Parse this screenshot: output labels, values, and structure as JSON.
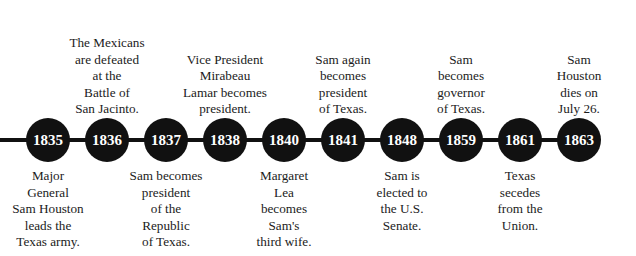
{
  "figure": {
    "type": "horizontal-timeline",
    "title": "",
    "background_color": "#ffffff",
    "node_color": "#111111",
    "node_text_color": "#ffffff",
    "caption_color": "#1b1b1b",
    "axis_color": "#111111"
  },
  "events": [
    {
      "year": "1835",
      "caption": "Major\nGeneral\nSam Houston\nleads the\nTexas army.",
      "caption_position": "below",
      "x": 48
    },
    {
      "year": "1836",
      "caption": "The Mexicans\nare defeated\nat the\nBattle of\nSan Jacinto.",
      "caption_position": "above",
      "x": 107
    },
    {
      "year": "1837",
      "caption": "Sam becomes\npresident\nof the\nRepublic\nof Texas.",
      "caption_position": "below",
      "x": 166
    },
    {
      "year": "1838",
      "caption": "Vice President\nMirabeau\nLamar becomes\npresident.",
      "caption_position": "above",
      "x": 225
    },
    {
      "year": "1840",
      "caption": "Margaret\nLea\nbecomes\nSam's\nthird wife.",
      "caption_position": "below",
      "x": 284
    },
    {
      "year": "1841",
      "caption": "Sam again\nbecomes\npresident\nof Texas.",
      "caption_position": "above",
      "x": 343
    },
    {
      "year": "1848",
      "caption": "Sam is\nelected to\nthe U.S.\nSenate.",
      "caption_position": "below",
      "x": 402
    },
    {
      "year": "1859",
      "caption": "Sam\nbecomes\ngovernor\nof Texas.",
      "caption_position": "above",
      "x": 461
    },
    {
      "year": "1861",
      "caption": "Texas\nsecedes\nfrom the\nUnion.",
      "caption_position": "below",
      "x": 520
    },
    {
      "year": "1863",
      "caption": "Sam\nHouston\ndies on\nJuly 26.",
      "caption_position": "above",
      "x": 579
    }
  ]
}
